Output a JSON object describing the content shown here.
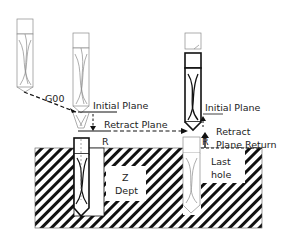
{
  "diagram": {
    "labels": {
      "g00": "G00",
      "initial_plane_1": "Initial Plane",
      "retract_plane": "Retract Plane",
      "r_1": "R",
      "z_dept_line1": "Z",
      "z_dept_line2": "Dept",
      "initial_plane_2": "Initial Plane",
      "retract": "Retract",
      "plane_return": "Plane Return",
      "r_2": "R",
      "last_hole_line1": "Last",
      "last_hole_line2": "hole"
    },
    "colors": {
      "line": "#111111",
      "faded": "#9a9a9a",
      "hatch": "#111111",
      "background": "#ffffff"
    },
    "tools": [
      {
        "name": "drill-start-position",
        "style": "faded"
      },
      {
        "name": "drill-at-initial-plane",
        "style": "faded"
      },
      {
        "name": "drill-at-retract-plane-second-hole",
        "style": "bold"
      },
      {
        "name": "drill-in-first-hole",
        "style": "bold"
      },
      {
        "name": "drill-in-last-hole",
        "style": "faded"
      }
    ]
  }
}
